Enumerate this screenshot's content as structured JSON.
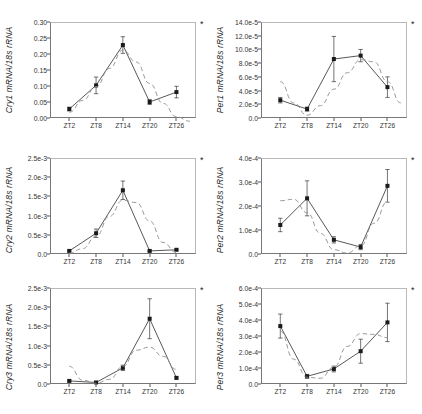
{
  "figure": {
    "panel_count": 6,
    "significance_marker": "*",
    "xlabels": [
      "ZT2",
      "ZT8",
      "ZT14",
      "ZT20",
      "ZT26"
    ]
  },
  "chart_data": [
    {
      "type": "line",
      "title": "",
      "panel": "Cry1",
      "ylabel": "Cry1 mRNA/18s rRNA",
      "xlabel": "",
      "categories": [
        "ZT2",
        "ZT8",
        "ZT14",
        "ZT20",
        "ZT26"
      ],
      "ylim": [
        0.0,
        0.3
      ],
      "yticks": [
        0.0,
        0.05,
        0.1,
        0.15,
        0.2,
        0.25,
        0.3
      ],
      "ytick_labels": [
        "0.00",
        "0.05",
        "0.10",
        "0.15",
        "0.20",
        "0.25",
        "0.30"
      ],
      "grid": false,
      "legend": "none",
      "annotation": "*",
      "series": [
        {
          "name": "measured",
          "style": "solid-markers",
          "values": [
            0.028,
            0.102,
            0.228,
            0.05,
            0.081
          ],
          "errors": [
            0.006,
            0.026,
            0.026,
            0.008,
            0.018
          ]
        },
        {
          "name": "fitted-cosine",
          "style": "dashed",
          "x": [
            0.0,
            0.5,
            1.0,
            1.5,
            2.0,
            2.5,
            3.0,
            3.5,
            4.0,
            4.5
          ],
          "values": [
            0.018,
            0.055,
            0.098,
            0.155,
            0.212,
            0.175,
            0.108,
            0.046,
            0.004,
            -0.01
          ]
        }
      ]
    },
    {
      "type": "line",
      "title": "",
      "panel": "Per1",
      "ylabel": "Per1 mRNA/18s rRNA",
      "xlabel": "",
      "categories": [
        "ZT2",
        "ZT8",
        "ZT14",
        "ZT20",
        "ZT26"
      ],
      "ylim": [
        0.0,
        0.00014
      ],
      "yticks": [
        0.0,
        2e-05,
        4e-05,
        6e-05,
        8e-05,
        0.0001,
        0.00012,
        0.00014
      ],
      "ytick_labels": [
        "0.0",
        "2.0e-5",
        "4.0e-5",
        "6.0e-5",
        "8.0e-5",
        "10.0e-5",
        "12.0e-5",
        "14.0e-5"
      ],
      "grid": false,
      "legend": "none",
      "annotation": "*",
      "series": [
        {
          "name": "measured",
          "style": "solid-markers",
          "values": [
            2.6e-05,
            1.3e-05,
            8.6e-05,
            9.1e-05,
            4.5e-05
          ],
          "errors": [
            4e-06,
            3e-06,
            3.3e-05,
            9e-06,
            1.5e-05
          ]
        },
        {
          "name": "fitted-cosine",
          "style": "dashed",
          "x": [
            0.0,
            0.5,
            1.0,
            1.5,
            2.0,
            2.5,
            3.0,
            3.5,
            4.0,
            4.5
          ],
          "values": [
            5.3e-05,
            2.2e-05,
            4e-06,
            1.8e-05,
            4.2e-05,
            6.6e-05,
            8.5e-05,
            8.2e-05,
            5.3e-05,
            2.2e-05
          ]
        }
      ]
    },
    {
      "type": "line",
      "title": "",
      "panel": "Cry2",
      "ylabel": "Cry2 mRNA/18s rRNA",
      "xlabel": "",
      "categories": [
        "ZT2",
        "ZT8",
        "ZT14",
        "ZT20",
        "ZT26"
      ],
      "ylim": [
        0.0,
        0.0025
      ],
      "yticks": [
        0.0,
        0.0005,
        0.001,
        0.0015,
        0.002,
        0.0025
      ],
      "ytick_labels": [
        "0.0",
        "0.5e-3",
        "1.0e-3",
        "1.5e-3",
        "2.0e-3",
        "2.5e-3"
      ],
      "grid": false,
      "legend": "none",
      "annotation": "*",
      "series": [
        {
          "name": "measured",
          "style": "solid-markers",
          "values": [
            8e-05,
            0.00054,
            0.00166,
            8e-05,
            0.00011
          ],
          "errors": [
            2e-05,
            0.00011,
            0.00024,
            2e-05,
            2e-05
          ]
        },
        {
          "name": "fitted-cosine",
          "style": "dashed",
          "x": [
            0.0,
            0.5,
            1.0,
            1.5,
            2.0,
            2.5,
            3.0,
            3.5,
            4.0
          ],
          "values": [
            2e-05,
            0.00014,
            0.00046,
            0.00098,
            0.0014,
            0.00134,
            0.00086,
            0.0003,
            4e-05
          ]
        }
      ]
    },
    {
      "type": "line",
      "title": "",
      "panel": "Per2",
      "ylabel": "Per2 mRNA/18s rRNA",
      "xlabel": "",
      "categories": [
        "ZT2",
        "ZT8",
        "ZT14",
        "ZT20",
        "ZT26"
      ],
      "ylim": [
        0.0,
        0.0004
      ],
      "yticks": [
        0.0,
        0.0001,
        0.0002,
        0.0003,
        0.0004
      ],
      "ytick_labels": [
        "0.0",
        "1.0e-4",
        "2.0e-4",
        "3.0e-4",
        "4.0e-4"
      ],
      "grid": false,
      "legend": "none",
      "annotation": "*",
      "series": [
        {
          "name": "measured",
          "style": "solid-markers",
          "values": [
            0.000121,
            0.000232,
            5.9e-05,
            2.9e-05,
            0.000284
          ],
          "errors": [
            2.8e-05,
            7.3e-05,
            1.3e-05,
            1.1e-05,
            6.8e-05
          ]
        },
        {
          "name": "fitted-cosine",
          "style": "dashed",
          "x": [
            0.0,
            0.5,
            1.0,
            1.5,
            2.0,
            2.5,
            3.0,
            3.5,
            4.0
          ],
          "values": [
            0.000222,
            0.000228,
            0.000172,
            8.6e-05,
            1.8e-05,
            4e-06,
            3.4e-05,
            0.000128,
            0.000218
          ]
        }
      ]
    },
    {
      "type": "line",
      "title": "",
      "panel": "Cry3",
      "ylabel": "Cry3 mRNA/18s rRNA",
      "xlabel": "",
      "categories": [
        "ZT2",
        "ZT8",
        "ZT14",
        "ZT20",
        "ZT26"
      ],
      "ylim": [
        0.0,
        0.0025
      ],
      "yticks": [
        0.0,
        0.0005,
        0.001,
        0.0015,
        0.002,
        0.0025
      ],
      "ytick_labels": [
        "0.0",
        "0.5e-3",
        "1.0e-3",
        "1.5e-3",
        "2.0e-3",
        "2.5e-3"
      ],
      "grid": false,
      "legend": "none",
      "annotation": "*",
      "series": [
        {
          "name": "measured",
          "style": "solid-markers",
          "values": [
            8e-05,
            4e-05,
            0.00042,
            0.0017,
            0.00016
          ],
          "errors": [
            2e-05,
            2e-05,
            7e-05,
            0.00052,
            3e-05
          ]
        },
        {
          "name": "fitted-cosine",
          "style": "dashed",
          "x": [
            0.0,
            0.5,
            1.0,
            1.5,
            2.0,
            2.5,
            3.0,
            3.5,
            4.0
          ],
          "values": [
            0.00046,
            0.0001,
            2e-05,
            0.00012,
            0.00046,
            0.00088,
            0.00096,
            0.00072,
            0.00038
          ]
        }
      ]
    },
    {
      "type": "line",
      "title": "",
      "panel": "Per3",
      "ylabel": "Per3 mRNA/18s rRNA",
      "xlabel": "",
      "categories": [
        "ZT2",
        "ZT8",
        "ZT14",
        "ZT20",
        "ZT26"
      ],
      "ylim": [
        0.0,
        0.0006
      ],
      "yticks": [
        0.0,
        0.0001,
        0.0002,
        0.0003,
        0.0004,
        0.0005,
        0.0006
      ],
      "ytick_labels": [
        "0.0",
        "1.0e-4",
        "2.0e-4",
        "3.0e-4",
        "4.0e-4",
        "5.0e-4",
        "6.0e-4"
      ],
      "grid": false,
      "legend": "none",
      "annotation": "*",
      "series": [
        {
          "name": "measured",
          "style": "solid-markers",
          "values": [
            0.000362,
            4.8e-05,
            9.4e-05,
            0.000205,
            0.000385
          ],
          "errors": [
            7.5e-05,
            1.2e-05,
            1.8e-05,
            7.5e-05,
            0.00012
          ]
        },
        {
          "name": "fitted-cosine",
          "style": "dashed",
          "x": [
            0.0,
            0.5,
            1.0,
            1.5,
            2.0,
            2.5,
            3.0,
            3.5,
            4.0
          ],
          "values": [
            0.00033,
            0.000155,
            4.2e-05,
            3.6e-05,
            0.000105,
            0.000235,
            0.000315,
            0.00031,
            0.00029
          ]
        }
      ]
    }
  ]
}
